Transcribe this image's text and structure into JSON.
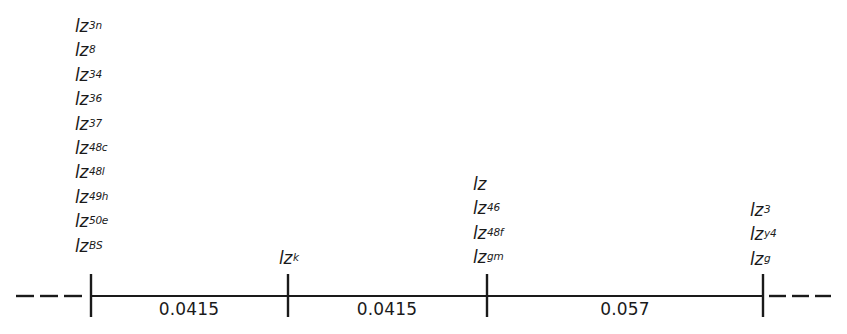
{
  "diagram": {
    "type": "genetic-linkage-map",
    "line_color": "#1a1a1a",
    "loci": [
      {
        "id": "locus-1",
        "x": 91,
        "labels": [
          {
            "base": "lz",
            "sup": "3n"
          },
          {
            "base": "lz",
            "sup": "8"
          },
          {
            "base": "lz",
            "sup": "34"
          },
          {
            "base": "lz",
            "sup": "36"
          },
          {
            "base": "lz",
            "sup": "37"
          },
          {
            "base": "lz",
            "sup": "48c"
          },
          {
            "base": "lz",
            "sup": "48l"
          },
          {
            "base": "lz",
            "sup": "49h"
          },
          {
            "base": "lz",
            "sup": "50e"
          },
          {
            "base": "lz",
            "sup": "BS"
          }
        ]
      },
      {
        "id": "locus-2",
        "x": 288,
        "labels": [
          {
            "base": "lz",
            "sup": "k"
          }
        ]
      },
      {
        "id": "locus-3",
        "x": 487,
        "labels": [
          {
            "base": "lz",
            "sup": ""
          },
          {
            "base": "lz",
            "sup": "46"
          },
          {
            "base": "lz",
            "sup": "48f"
          },
          {
            "base": "lz",
            "sup": "gm"
          }
        ]
      },
      {
        "id": "locus-4",
        "x": 763,
        "labels": [
          {
            "base": "lz",
            "sup": "3"
          },
          {
            "base": "lz",
            "sup": "y4"
          },
          {
            "base": "lz",
            "sup": "g"
          }
        ]
      }
    ],
    "intervals": [
      {
        "label": "0.0415",
        "from": "locus-1",
        "to": "locus-2"
      },
      {
        "label": "0.0415",
        "from": "locus-2",
        "to": "locus-3"
      },
      {
        "label": "0.057",
        "from": "locus-3",
        "to": "locus-4"
      }
    ],
    "left_extension": "dashed",
    "right_extension": "dashed"
  }
}
